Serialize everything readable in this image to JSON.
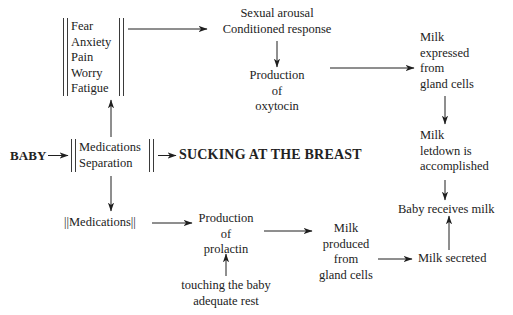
{
  "diagram": {
    "background_color": "#ffffff",
    "ink_color": "#222222",
    "nodes": {
      "inhibitors_emotional": {
        "lines": [
          "Fear",
          "Anxiety",
          "Pain",
          "Worry",
          "Fatigue"
        ],
        "bracket": "double-vertical-bars"
      },
      "baby": {
        "label": "BABY",
        "style": "bold"
      },
      "inhibitors_med_sep": {
        "lines": [
          "Medications",
          "Separation"
        ],
        "bracket": "double-vertical-bars"
      },
      "sucking": {
        "label": "SUCKING AT THE BREAST",
        "style": "bold"
      },
      "sexual_arousal": {
        "line1": "Sexual arousal",
        "line2": "Conditioned response"
      },
      "oxytocin": {
        "line1": "Production",
        "line2": "of",
        "line3": "oxytocin"
      },
      "milk_expressed": {
        "line1": "Milk",
        "line2": "expressed",
        "line3": "from",
        "line4": "gland cells"
      },
      "milk_letdown": {
        "line1": "Milk",
        "line2": "letdown is",
        "line3": "accomplished"
      },
      "baby_receives_milk": {
        "label": "Baby receives milk"
      },
      "inhibitor_medications": {
        "label": "||Medications||"
      },
      "prolactin": {
        "line1": "Production",
        "line2": "of",
        "line3": "prolactin"
      },
      "milk_produced": {
        "line1": "Milk",
        "line2": "produced",
        "line3": "from",
        "line4": "gland cells"
      },
      "milk_secreted": {
        "label": "Milk secreted"
      },
      "facilitators": {
        "line1": "touching the baby",
        "line2": "adequate rest"
      }
    },
    "edges": [
      {
        "from": "baby",
        "to": "inhibitors_med_sep",
        "direction": "right"
      },
      {
        "from": "inhibitors_med_sep",
        "to": "sucking",
        "direction": "right"
      },
      {
        "from": "inhibitors_med_sep",
        "to": "inhibitors_emotional",
        "direction": "up"
      },
      {
        "from": "inhibitors_med_sep",
        "to": "inhibitor_medications",
        "direction": "down"
      },
      {
        "from": "inhibitors_emotional",
        "to": "sexual_arousal",
        "direction": "right"
      },
      {
        "from": "sexual_arousal",
        "to": "oxytocin",
        "direction": "down"
      },
      {
        "from": "oxytocin",
        "to": "milk_expressed",
        "direction": "right"
      },
      {
        "from": "milk_expressed",
        "to": "milk_letdown",
        "direction": "down"
      },
      {
        "from": "milk_letdown",
        "to": "baby_receives_milk",
        "direction": "down"
      },
      {
        "from": "inhibitor_medications",
        "to": "prolactin",
        "direction": "right"
      },
      {
        "from": "facilitators",
        "to": "prolactin",
        "direction": "up"
      },
      {
        "from": "prolactin",
        "to": "milk_produced",
        "direction": "right"
      },
      {
        "from": "milk_produced",
        "to": "milk_secreted",
        "direction": "right"
      },
      {
        "from": "milk_secreted",
        "to": "baby_receives_milk",
        "direction": "up"
      }
    ]
  }
}
